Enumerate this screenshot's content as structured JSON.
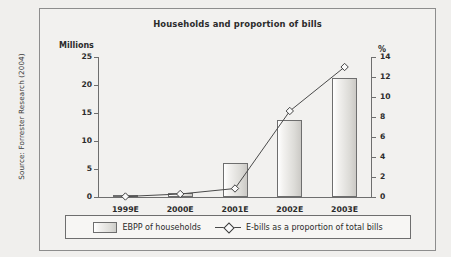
{
  "source_note": "Source: Forrester Research (2004)",
  "side_note": "E = year end",
  "chart_data": {
    "type": "bar",
    "title": "Households and proportion of bills",
    "categories": [
      "1999E",
      "2000E",
      "2001E",
      "2002E",
      "2003E"
    ],
    "xlabel": "",
    "ylabel": "Millions",
    "y2label": "%",
    "ylim": [
      0,
      25
    ],
    "y2lim": [
      0,
      14
    ],
    "yticks": [
      0,
      5,
      10,
      15,
      20,
      25
    ],
    "y2ticks": [
      0,
      2,
      4,
      6,
      8,
      10,
      12,
      14
    ],
    "ytick_labels": [
      "0",
      "5",
      "10",
      "15",
      "20",
      "25"
    ],
    "y2tick_labels": [
      "0",
      "2",
      "4",
      "6",
      "8",
      "10",
      "12",
      "14"
    ],
    "grid": false,
    "legend_position": "bottom",
    "series": [
      {
        "name": "EBPP  of households",
        "type": "bar",
        "axis": "left",
        "unit": "Millions",
        "values": [
          0.1,
          0.8,
          6.0,
          13.8,
          21.3
        ]
      },
      {
        "name": "E-bills as a proportion of total bills",
        "type": "line",
        "axis": "right",
        "unit": "%",
        "marker": "diamond",
        "values": [
          0.05,
          0.3,
          0.85,
          8.6,
          13.0
        ]
      }
    ]
  }
}
